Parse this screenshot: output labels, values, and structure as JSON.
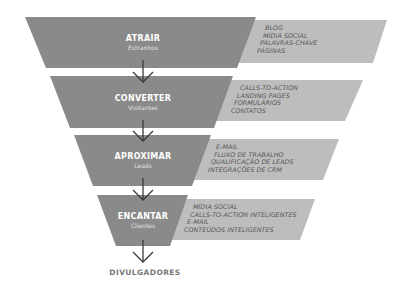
{
  "colors": {
    "stage_fill": "#8a8a8a",
    "tactic_fill": "#bdbdbd",
    "arrow": "#3a3a3a",
    "stage_text": "#ffffff",
    "tactic_text": "#555555",
    "final_text": "#777777"
  },
  "funnel": {
    "stages": [
      {
        "title": "ATRAIR",
        "subtitle": "Estranhos",
        "tactics": [
          "BLOG",
          "MÍDIA SOCIAL",
          "PALAVRAS-CHAVE",
          "PÁGINAS"
        ]
      },
      {
        "title": "CONVERTER",
        "subtitle": "Visitantes",
        "tactics": [
          "CALLS-TO-ACTION",
          "LANDING PAGES",
          "FORMULÁRIOS",
          "CONTATOS"
        ]
      },
      {
        "title": "APROXIMAR",
        "subtitle": "Leads",
        "tactics": [
          "E-MAIL",
          "FLUXO DE TRABALHO",
          "QUALIFICAÇÃO DE LEADS",
          "INTEGRAÇÕES DE CRM"
        ]
      },
      {
        "title": "ENCANTAR",
        "subtitle": "Clientes",
        "tactics": [
          "MÍDIA SOCIAL",
          "CALLS-TO-ACTION INTELIGENTES",
          "E-MAIL",
          "CONTEÚDOS INTELIGENTES"
        ]
      }
    ],
    "final_label": "DIVULGADORES"
  }
}
